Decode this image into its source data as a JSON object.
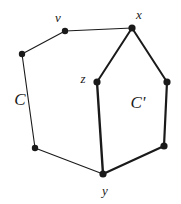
{
  "figure": {
    "type": "graph-diagram",
    "width": 181,
    "height": 204,
    "background": "#ffffff",
    "ink_color": "#1a1a1a"
  },
  "vertices": [
    {
      "id": "a",
      "label": "",
      "x": 22,
      "y": 54,
      "r": 3.2
    },
    {
      "id": "v",
      "label": "v",
      "x": 65,
      "y": 31,
      "r": 3.2
    },
    {
      "id": "x",
      "label": "x",
      "x": 132,
      "y": 28,
      "r": 3.6
    },
    {
      "id": "z",
      "label": "z",
      "x": 97,
      "y": 82,
      "r": 3.6
    },
    {
      "id": "w",
      "label": "",
      "x": 167,
      "y": 82,
      "r": 3.6
    },
    {
      "id": "b",
      "label": "",
      "x": 35,
      "y": 148,
      "r": 3.2
    },
    {
      "id": "y",
      "label": "y",
      "x": 103,
      "y": 174,
      "r": 3.6
    },
    {
      "id": "u",
      "label": "",
      "x": 164,
      "y": 146,
      "r": 3.6
    }
  ],
  "vertex_labels": [
    {
      "text": "v",
      "x": 58,
      "y": 17
    },
    {
      "text": "x",
      "x": 139,
      "y": 14
    },
    {
      "text": "z",
      "x": 83,
      "y": 78
    },
    {
      "text": "y",
      "x": 105,
      "y": 190
    }
  ],
  "cycle_labels": [
    {
      "text": "C",
      "x": 20,
      "y": 99
    },
    {
      "text": "C'",
      "x": 138,
      "y": 102
    }
  ],
  "edges": [
    {
      "from": "a",
      "to": "v",
      "weight": 1.1,
      "cycle": "C"
    },
    {
      "from": "v",
      "to": "x",
      "weight": 1.1,
      "cycle": "C"
    },
    {
      "from": "a",
      "to": "b",
      "weight": 1.1,
      "cycle": "C"
    },
    {
      "from": "b",
      "to": "y",
      "weight": 1.1,
      "cycle": "C"
    },
    {
      "from": "x",
      "to": "z",
      "weight": 2.0,
      "cycle": "shared"
    },
    {
      "from": "z",
      "to": "y",
      "weight": 2.4,
      "cycle": "shared"
    },
    {
      "from": "x",
      "to": "w",
      "weight": 2.0,
      "cycle": "C-prime"
    },
    {
      "from": "w",
      "to": "u",
      "weight": 2.2,
      "cycle": "C-prime"
    },
    {
      "from": "u",
      "to": "y",
      "weight": 2.2,
      "cycle": "C-prime"
    }
  ]
}
